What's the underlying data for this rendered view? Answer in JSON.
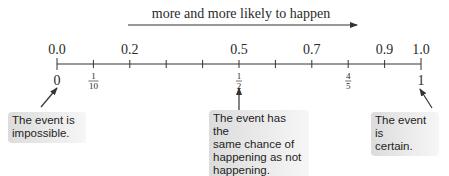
{
  "header": {
    "arrow_label": "more and more likely to happen"
  },
  "number_line": {
    "min": 0,
    "max": 1,
    "tick_step": 0.1,
    "decimal_labels": [
      {
        "value": 0.0,
        "text": "0.0"
      },
      {
        "value": 0.2,
        "text": "0.2"
      },
      {
        "value": 0.5,
        "text": "0.5"
      },
      {
        "value": 0.7,
        "text": "0.7"
      },
      {
        "value": 0.9,
        "text": "0.9"
      },
      {
        "value": 1.0,
        "text": "1.0"
      }
    ],
    "fraction_labels": [
      {
        "value": 0.0,
        "whole": "0"
      },
      {
        "value": 0.1,
        "num": "1",
        "den": "10"
      },
      {
        "value": 0.5,
        "num": "1",
        "den": "2"
      },
      {
        "value": 0.8,
        "num": "4",
        "den": "5"
      },
      {
        "value": 1.0,
        "whole": "1"
      }
    ]
  },
  "callouts": {
    "impossible": "The event is\nimpossible.",
    "even": "The event has the\nsame chance of\nhappening as not\nhappening.",
    "certain": "The event is\ncertain."
  },
  "colors": {
    "line": "#333333",
    "text": "#2a2a2a",
    "callout_bg": "#e6e6e6"
  }
}
